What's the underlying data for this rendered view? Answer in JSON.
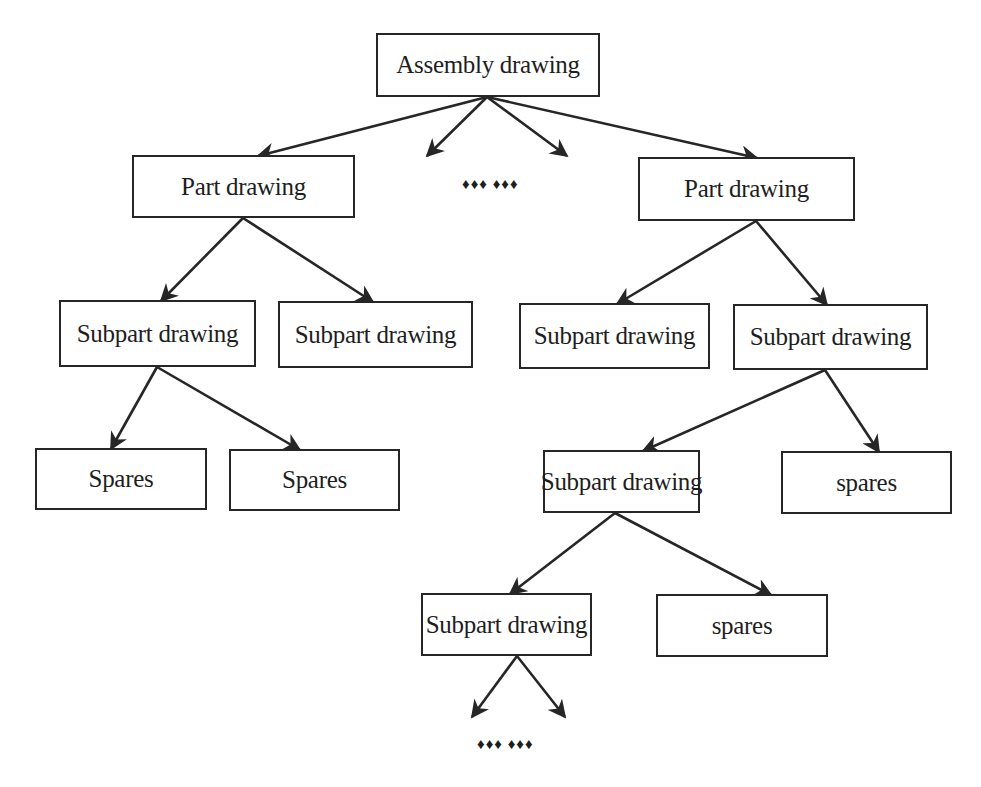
{
  "diagram": {
    "type": "tree",
    "nodes": {
      "root": "Assembly drawing",
      "part_left": "Part drawing",
      "part_right": "Part drawing",
      "sub_l1": "Subpart drawing",
      "sub_l2": "Subpart drawing",
      "sub_r1": "Subpart drawing",
      "sub_r2": "Subpart drawing",
      "spares_l1": "Spares",
      "spares_l2": "Spares",
      "sub_r3": "Subpart drawing",
      "spares_r2": "spares",
      "sub_r4": "Subpart drawing",
      "spares_r3": "spares"
    },
    "ellipsis_top": "♦♦♦ ♦♦♦",
    "ellipsis_bottom": "♦♦♦ ♦♦♦",
    "edges": [
      [
        "root",
        "part_left"
      ],
      [
        "root",
        "ellipsis_top"
      ],
      [
        "root",
        "ellipsis_top"
      ],
      [
        "root",
        "part_right"
      ],
      [
        "part_left",
        "sub_l1"
      ],
      [
        "part_left",
        "sub_l2"
      ],
      [
        "part_right",
        "sub_r1"
      ],
      [
        "part_right",
        "sub_r2"
      ],
      [
        "sub_l1",
        "spares_l1"
      ],
      [
        "sub_l1",
        "spares_l2"
      ],
      [
        "sub_r2",
        "sub_r3"
      ],
      [
        "sub_r2",
        "spares_r2"
      ],
      [
        "sub_r3",
        "sub_r4"
      ],
      [
        "sub_r3",
        "spares_r3"
      ],
      [
        "sub_r4",
        "ellipsis_bottom"
      ],
      [
        "sub_r4",
        "ellipsis_bottom"
      ]
    ]
  }
}
